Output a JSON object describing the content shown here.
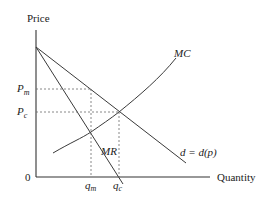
{
  "diagram": {
    "y_axis": {
      "label": "Price"
    },
    "x_axis": {
      "label": "Quantity"
    },
    "origin_label": "0",
    "curves": {
      "mc": {
        "label": "MC"
      },
      "mr": {
        "label": "MR"
      },
      "demand": {
        "label": "d = d(p)"
      }
    },
    "price_levels": [
      {
        "symbol": "P",
        "subscript": "m",
        "meaning": "monopoly price"
      },
      {
        "symbol": "P",
        "subscript": "c",
        "meaning": "competitive price"
      }
    ],
    "quantity_levels": [
      {
        "symbol": "q",
        "subscript": "m",
        "meaning": "monopoly quantity"
      },
      {
        "symbol": "q",
        "subscript": "c",
        "meaning": "competitive quantity"
      }
    ]
  }
}
